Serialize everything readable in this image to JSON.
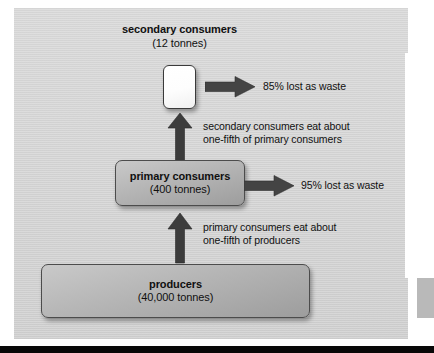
{
  "diagram": {
    "type": "energy-flow-pyramid",
    "levels": [
      {
        "id": "secondary",
        "title": "secondary consumers",
        "amount": "(12 tonnes)",
        "box_style": "white"
      },
      {
        "id": "primary",
        "title": "primary consumers",
        "amount": "(400 tonnes)",
        "box_style": "gray"
      },
      {
        "id": "producers",
        "title": "producers",
        "amount": "(40,000 tonnes)",
        "box_style": "gray"
      }
    ],
    "waste_labels": [
      {
        "id": "secondary-waste",
        "text": "85% lost as waste"
      },
      {
        "id": "primary-waste",
        "text": "95% lost as waste"
      }
    ],
    "transfer_notes": [
      {
        "id": "secondary-eats",
        "line1": "secondary consumers eat about",
        "line2": "one-fifth of primary consumers"
      },
      {
        "id": "primary-eats",
        "line1": "primary consumers eat about",
        "line2": "one-fifth of producers"
      }
    ],
    "colors": {
      "background": "#d6d6d6",
      "arrow": "#3f3f3f",
      "box_border": "#4c4c4c",
      "text": "#101010",
      "bottom_bar": "#080808",
      "panel_white": "#ffffff"
    }
  }
}
